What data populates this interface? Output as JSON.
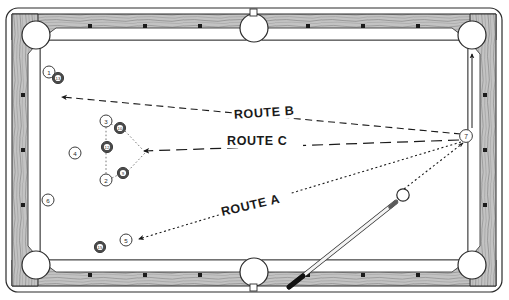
{
  "diagram": {
    "table": {
      "felt_color": "#ffffff",
      "rail_color": "#b9b9b9",
      "rail_outline": "#2b2b2b",
      "pocket_fill": "#ffffff",
      "sight_dot_color": "#1c1c1c",
      "outer": {
        "x": 6,
        "y": 8,
        "w": 496,
        "h": 284
      },
      "inner_felt": {
        "x": 40,
        "y": 40,
        "w": 428,
        "h": 220
      }
    },
    "routes": [
      {
        "id": "route-a",
        "label": "ROUTE A",
        "style": "dotted",
        "label_x": 255,
        "label_y": 207,
        "label_rotation": -13,
        "arrow_target": "ball-5",
        "description": "Cue ball to ball 7 then cross-table to ball 5"
      },
      {
        "id": "route-b",
        "label": "ROUTE B",
        "style": "dashed",
        "label_x": 268,
        "label_y": 114,
        "label_rotation": -4,
        "arrow_target": "upper-left",
        "description": "Long dashed line from ball 7 to upper left area"
      },
      {
        "id": "route-c",
        "label": "ROUTE C",
        "style": "long-dash",
        "label_x": 263,
        "label_y": 143,
        "label_rotation": 0,
        "arrow_target": "ball-cluster",
        "description": "Straight dashed line from ball 7 into the ball cluster"
      }
    ],
    "balls": [
      {
        "name": "ball-1",
        "number": "1",
        "type": "solid",
        "x": 49,
        "y": 72,
        "r": 6.0
      },
      {
        "name": "ball-13",
        "number": "13",
        "type": "stripe",
        "x": 58,
        "y": 78,
        "r": 5.6
      },
      {
        "name": "ball-3",
        "number": "3",
        "type": "solid",
        "x": 106,
        "y": 121,
        "r": 6.0
      },
      {
        "name": "ball-10",
        "number": "10",
        "type": "stripe",
        "x": 120,
        "y": 128,
        "r": 5.6
      },
      {
        "name": "ball-12",
        "number": "12",
        "type": "stripe",
        "x": 107,
        "y": 147,
        "r": 5.6
      },
      {
        "name": "ball-4",
        "number": "4",
        "type": "solid",
        "x": 75,
        "y": 153,
        "r": 6.0
      },
      {
        "name": "ball-2",
        "number": "2",
        "type": "solid",
        "x": 106,
        "y": 180,
        "r": 6.0
      },
      {
        "name": "ball-9",
        "number": "9",
        "type": "stripe",
        "x": 123,
        "y": 173,
        "r": 5.6
      },
      {
        "name": "ball-6",
        "number": "6",
        "type": "solid",
        "x": 48,
        "y": 200,
        "r": 6.0
      },
      {
        "name": "ball-15",
        "number": "15",
        "type": "stripe",
        "x": 100,
        "y": 247,
        "r": 5.6
      },
      {
        "name": "ball-5",
        "number": "5",
        "type": "solid",
        "x": 126,
        "y": 240,
        "r": 6.0
      },
      {
        "name": "ball-7",
        "number": "7",
        "type": "solid",
        "x": 466,
        "y": 136,
        "r": 6.4
      }
    ],
    "cue_ball": {
      "name": "cue-ball",
      "x": 403,
      "y": 195,
      "r": 6.2,
      "label": "cue ball"
    },
    "cue_stick": {
      "name": "cue-stick",
      "tip_x": 396,
      "tip_y": 202,
      "butt_x": 289,
      "butt_y": 287,
      "shaft_color": "#f2f2f2",
      "butt_color": "#111111"
    },
    "pockets": [
      {
        "name": "pocket-top-left",
        "x": 36,
        "y": 35,
        "r": 14
      },
      {
        "name": "pocket-top-center",
        "x": 254,
        "y": 28,
        "r": 14
      },
      {
        "name": "pocket-top-right",
        "x": 472,
        "y": 35,
        "r": 14
      },
      {
        "name": "pocket-bottom-left",
        "x": 36,
        "y": 265,
        "r": 14
      },
      {
        "name": "pocket-bottom-center",
        "x": 254,
        "y": 272,
        "r": 14
      },
      {
        "name": "pocket-bottom-right",
        "x": 472,
        "y": 265,
        "r": 14
      }
    ],
    "sight_dots": {
      "top": [
        90,
        145,
        200,
        308,
        363,
        418
      ],
      "bottom": [
        90,
        145,
        200,
        308,
        363,
        418
      ],
      "left": [
        95,
        150,
        205
      ],
      "right": [
        95,
        150,
        205
      ]
    }
  }
}
